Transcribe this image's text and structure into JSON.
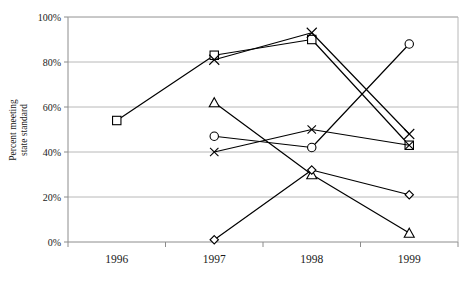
{
  "chart_data": {
    "type": "line",
    "title": "",
    "xlabel": "",
    "ylabel": "Percent meeting state standard",
    "ylabel_line1": "Percent meeting",
    "ylabel_line2": "state standard",
    "categories": [
      "1996",
      "1997",
      "1998",
      "1999"
    ],
    "x_tick_labels": [
      "1996",
      "1997",
      "1998",
      "1999"
    ],
    "y_tick_labels": [
      "0%",
      "20%",
      "40%",
      "60%",
      "80%",
      "100%"
    ],
    "y_tick_values": [
      0,
      20,
      40,
      60,
      80,
      100
    ],
    "ylim": [
      0,
      100
    ],
    "grid": "horizontal",
    "legend": "none",
    "series": [
      {
        "name": "Series 1",
        "marker": "square",
        "color": "#000000",
        "points": [
          {
            "x": "1996",
            "y": 54
          },
          {
            "x": "1997",
            "y": 83
          },
          {
            "x": "1998",
            "y": 90
          },
          {
            "x": "1999",
            "y": 43
          }
        ]
      },
      {
        "name": "Series 2",
        "marker": "x",
        "color": "#000000",
        "points": [
          {
            "x": "1997",
            "y": 81
          },
          {
            "x": "1998",
            "y": 93
          },
          {
            "x": "1999",
            "y": 48
          }
        ]
      },
      {
        "name": "Series 3",
        "marker": "triangle",
        "color": "#000000",
        "points": [
          {
            "x": "1997",
            "y": 62
          },
          {
            "x": "1998",
            "y": 30
          },
          {
            "x": "1999",
            "y": 4
          }
        ]
      },
      {
        "name": "Series 4",
        "marker": "circle",
        "color": "#000000",
        "points": [
          {
            "x": "1997",
            "y": 47
          },
          {
            "x": "1998",
            "y": 42
          },
          {
            "x": "1999",
            "y": 88
          }
        ]
      },
      {
        "name": "Series 5",
        "marker": "x-small",
        "color": "#000000",
        "points": [
          {
            "x": "1997",
            "y": 40
          },
          {
            "x": "1998",
            "y": 50
          },
          {
            "x": "1999",
            "y": 43
          }
        ]
      },
      {
        "name": "Series 6",
        "marker": "diamond",
        "color": "#000000",
        "points": [
          {
            "x": "1997",
            "y": 1
          },
          {
            "x": "1998",
            "y": 32
          },
          {
            "x": "1999",
            "y": 21
          }
        ]
      }
    ],
    "colors": {
      "line": "#000000",
      "grid": "#b0b0b0",
      "axis": "#8c8c8c",
      "text": "#1a1a1a",
      "background": "#ffffff"
    }
  }
}
